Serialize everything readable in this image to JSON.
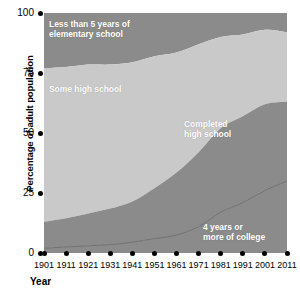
{
  "chart_data": {
    "type": "area",
    "title": "",
    "xlabel": "Year",
    "ylabel": "Percentage of adult population",
    "categories": [
      1901,
      1911,
      1921,
      1931,
      1941,
      1951,
      1961,
      1971,
      1981,
      1991,
      2001,
      2011
    ],
    "x": [
      1901,
      1911,
      1921,
      1931,
      1941,
      1951,
      1961,
      1971,
      1981,
      1991,
      2001,
      2011
    ],
    "xlim": [
      1901,
      2011
    ],
    "ylim": [
      0,
      100
    ],
    "xticks": [
      "1901",
      "1911",
      "1921",
      "1931",
      "1941",
      "1951",
      "1961",
      "1971",
      "1981",
      "1991",
      "2001",
      "2011"
    ],
    "yticks": [
      "0",
      "25",
      "50",
      "75",
      "100"
    ],
    "ytick_values": [
      0,
      25,
      50,
      75,
      100
    ],
    "grid": false,
    "legend": "in-plot band labels",
    "stacked": true,
    "series": [
      {
        "name": "4 years or more of college",
        "color": "#8b8b8b",
        "values": [
          2,
          2.5,
          3,
          3.5,
          4.5,
          6,
          7.5,
          11,
          17,
          21,
          26,
          30
        ]
      },
      {
        "name": "Completed high school",
        "color": "#8b8b8b",
        "values": [
          11,
          12,
          13.5,
          15,
          17,
          21,
          26,
          31,
          35,
          36,
          36,
          33
        ]
      },
      {
        "name": "Some high school",
        "color": "#c9c9c9",
        "values": [
          64,
          63,
          62,
          60,
          58,
          55,
          50,
          45,
          38,
          34,
          31,
          29
        ]
      },
      {
        "name": "Less than 5 years of elementary school",
        "color": "#8b8b8b",
        "values": [
          23,
          22.5,
          21.5,
          21.5,
          20.5,
          18,
          16.5,
          13,
          10,
          9,
          7,
          8
        ]
      }
    ],
    "cumulative_boundaries": {
      "college_top": [
        2,
        2.5,
        3,
        3.5,
        4.5,
        6,
        7.5,
        11,
        17,
        21,
        26,
        30
      ],
      "completed_hs_top": [
        13,
        14.5,
        16.5,
        18.5,
        21.5,
        27,
        33.5,
        42,
        52,
        57,
        62,
        63
      ],
      "some_hs_top": [
        77,
        77.5,
        78.5,
        78.5,
        79.5,
        82,
        83.5,
        87,
        90,
        91,
        93,
        92
      ],
      "total_top": [
        100,
        100,
        100,
        100,
        100,
        100,
        100,
        100,
        100,
        100,
        100,
        100
      ]
    },
    "band_labels": {
      "elementary": "Less than 5 years of\nelementary school",
      "some_high_school": "Some high school",
      "completed_high_school": "Completed\nhigh school",
      "college": "4 years or\nmore of college"
    },
    "colors": {
      "dark_band": "#8b8b8b",
      "light_band": "#c9c9c9",
      "background": "#ffffff",
      "axis": "#000000",
      "label_text": "#ffffff",
      "separator_line": "#6f6f6f"
    }
  }
}
